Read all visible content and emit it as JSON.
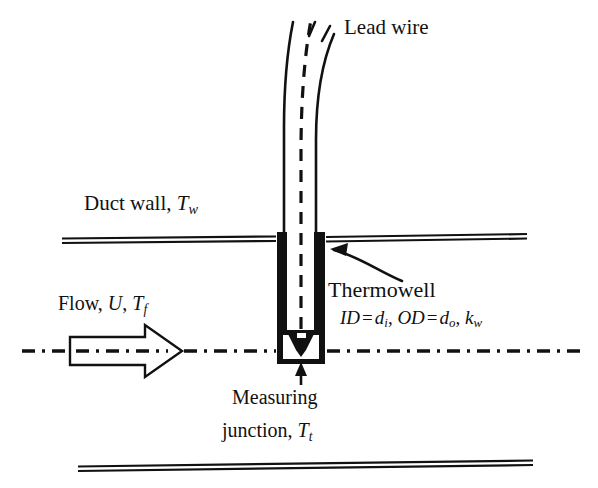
{
  "figure": {
    "background_color": "#ffffff",
    "line_color": "#111111",
    "width": 598,
    "height": 488
  },
  "labels": {
    "lead_wire": "Lead wire",
    "duct_wall": "Duct wall, ",
    "duct_wall_symbol": "T",
    "duct_wall_subscript": "w",
    "flow_prefix": "Flow, ",
    "flow_velocity": "U",
    "flow_comma": ", ",
    "flow_temp_symbol": "T",
    "flow_temp_subscript": "f",
    "thermowell": "Thermowell",
    "id_symbol": "ID",
    "equals_1": "=",
    "id_value": "d",
    "id_value_subscript": "i",
    "comma_1": ", ",
    "od_symbol": "OD",
    "equals_2": "=",
    "od_value": "d",
    "od_value_subscript": "o",
    "comma_2": ", ",
    "conductivity_symbol": "k",
    "conductivity_subscript": "w",
    "measuring": "Measuring",
    "junction_prefix": "junction, ",
    "junction_symbol": "T",
    "junction_subscript": "t"
  },
  "components": {
    "upper_duct_wall": "upper-duct-wall",
    "lower_duct_wall": "lower-duct-wall",
    "thermowell_tube": "thermowell-tube",
    "lead_wire_bundle": "lead-wire-bundle",
    "thermocouple_dashed_line": "thermocouple-dashed-line",
    "measuring_junction_box": "measuring-junction-box",
    "flow_arrow": "flow-arrow",
    "flow_centerline": "flow-centerline",
    "thermowell_callout_arrow": "thermowell-callout-arrow",
    "junction_callout_arrow": "junction-callout-arrow"
  },
  "geometry": {
    "upper_wall_y": 239,
    "lower_wall_y": 464,
    "centerline_y": 351,
    "thermowell_left_x": 277,
    "thermowell_right_x": 325,
    "thermowell_bottom_y": 363
  }
}
